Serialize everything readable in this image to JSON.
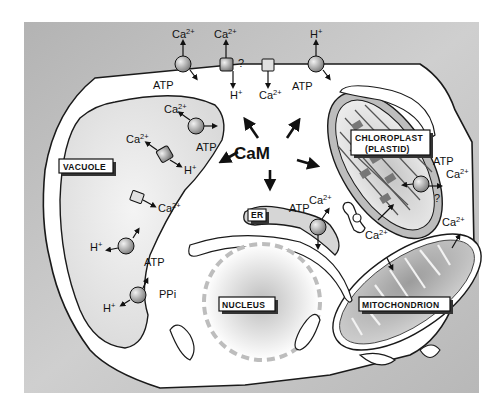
{
  "figure": {
    "type": "plant cell calcium transport diagram",
    "center_label": "CaM",
    "organelles": {
      "vacuole": "VACUOLE",
      "chloroplast_line1": "CHLOROPLAST",
      "chloroplast_line2": "(PLASTID)",
      "er": "ER",
      "nucleus": "NUCLEUS",
      "mitochondrion": "MITOCHONDRION"
    },
    "ions": {
      "ca_base": "Ca",
      "ca_charge": "2+",
      "h_base": "H",
      "h_charge": "+",
      "atp": "ATP",
      "ppi": "PPi",
      "unknown": "?"
    },
    "colors": {
      "background": "#b9b9b9",
      "cytoplasm": "#ffffff",
      "outline": "#1a1a1a",
      "organelle_fill": "#d6d6d6",
      "label_box": "#ffffff"
    }
  }
}
